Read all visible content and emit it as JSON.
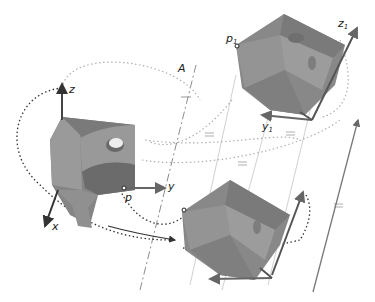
{
  "diagram": {
    "type": "rigid-body screw motion illustration",
    "labels": {
      "axis_A": "A",
      "x": "x",
      "y": "y",
      "z": "z",
      "p": "p",
      "p1": "p",
      "p1_sub": "1",
      "y1": "y",
      "y1_sub": "1",
      "z1": "z",
      "z1_sub": "1"
    },
    "colors": {
      "block": "#8a8a8a",
      "block_dark": "#6e6e6e",
      "block_light": "#a6a6a6",
      "axis_arrow": "#555555",
      "dotted_path": "#333333",
      "guide_line": "#bdbdbd",
      "axis_line": "#8c8c8c"
    }
  }
}
